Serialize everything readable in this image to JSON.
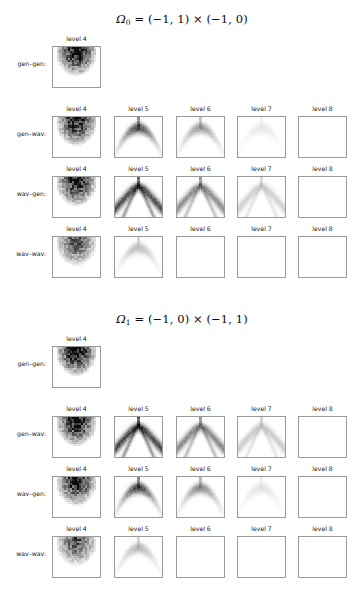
{
  "figure": {
    "width": 364,
    "height": 606,
    "background": "#ffffff",
    "panel_border_color": "#9a9a9a",
    "text_color": "#1a1a1a"
  },
  "chart_data": {
    "type": "heatmap",
    "title": "",
    "colormap": "grayscale (white = 0, black = max)",
    "row_labels": [
      "gen–gen:",
      "gen–wav:",
      "wav–gen:",
      "wav–wav:"
    ],
    "column_labels": [
      "level 4",
      "level 5",
      "level 6",
      "level 7",
      "level 8"
    ],
    "blocks": [
      {
        "id": "omega0",
        "title_plain": "Ω₀ = (−1,1) × (−1,0)",
        "title_parts": {
          "symbol": "Ω",
          "subscript": "0",
          "equals": "=",
          "interval_x": "(−1, 1)",
          "times": "×",
          "interval_y": "(−1, 0)"
        },
        "orientation": "vertical",
        "rows": [
          {
            "label": "gen–gen:",
            "panels": [
              {
                "level_label": "level 4",
                "kind": "blob",
                "intensity": 1.0,
                "blur": 0.0,
                "seed": 11
              }
            ]
          },
          {
            "label": "gen–wav:",
            "panels": [
              {
                "level_label": "level 4",
                "kind": "blob",
                "intensity": 0.92,
                "blur": 0.0,
                "seed": 21
              },
              {
                "level_label": "level 5",
                "kind": "arc",
                "intensity": 0.62,
                "blur": 1.0,
                "seed": 22
              },
              {
                "level_label": "level 6",
                "kind": "arc",
                "intensity": 0.34,
                "blur": 1.0,
                "seed": 23
              },
              {
                "level_label": "level 7",
                "kind": "arc",
                "intensity": 0.08,
                "blur": 1.0,
                "seed": 24
              },
              {
                "level_label": "level 8",
                "kind": "empty",
                "intensity": 0.01,
                "blur": 1.0,
                "seed": 25
              }
            ]
          },
          {
            "label": "wav–gen:",
            "panels": [
              {
                "level_label": "level 4",
                "kind": "blob",
                "intensity": 0.95,
                "blur": 0.0,
                "seed": 31
              },
              {
                "level_label": "level 5",
                "kind": "vee",
                "intensity": 0.7,
                "blur": 1.0,
                "seed": 32
              },
              {
                "level_label": "level 6",
                "kind": "vee",
                "intensity": 0.45,
                "blur": 1.0,
                "seed": 33
              },
              {
                "level_label": "level 7",
                "kind": "vee",
                "intensity": 0.18,
                "blur": 1.0,
                "seed": 34
              },
              {
                "level_label": "level 8",
                "kind": "empty",
                "intensity": 0.02,
                "blur": 1.0,
                "seed": 35
              }
            ]
          },
          {
            "label": "wav–wav:",
            "panels": [
              {
                "level_label": "level 4",
                "kind": "blob",
                "intensity": 0.7,
                "blur": 0.0,
                "seed": 41
              },
              {
                "level_label": "level 5",
                "kind": "arc",
                "intensity": 0.22,
                "blur": 1.0,
                "seed": 42
              },
              {
                "level_label": "level 6",
                "kind": "empty",
                "intensity": 0.01,
                "blur": 1.0,
                "seed": 43
              },
              {
                "level_label": "level 7",
                "kind": "empty",
                "intensity": 0.0,
                "blur": 1.0,
                "seed": 44
              },
              {
                "level_label": "level 8",
                "kind": "empty",
                "intensity": 0.0,
                "blur": 1.0,
                "seed": 45
              }
            ]
          }
        ]
      },
      {
        "id": "omega1",
        "title_plain": "Ω₁ = (−1,0) × (−1,1)",
        "title_parts": {
          "symbol": "Ω",
          "subscript": "1",
          "equals": "=",
          "interval_x": "(−1, 0)",
          "times": "×",
          "interval_y": "(−1, 1)"
        },
        "orientation": "horizontal",
        "rows": [
          {
            "label": "gen–gen:",
            "panels": [
              {
                "level_label": "level 4",
                "kind": "blob",
                "intensity": 1.0,
                "blur": 0.0,
                "seed": 51
              }
            ]
          },
          {
            "label": "gen–wav:",
            "panels": [
              {
                "level_label": "level 4",
                "kind": "blob",
                "intensity": 0.95,
                "blur": 0.0,
                "seed": 61
              },
              {
                "level_label": "level 5",
                "kind": "vee",
                "intensity": 0.72,
                "blur": 1.0,
                "seed": 62
              },
              {
                "level_label": "level 6",
                "kind": "vee",
                "intensity": 0.46,
                "blur": 1.0,
                "seed": 63
              },
              {
                "level_label": "level 7",
                "kind": "vee",
                "intensity": 0.2,
                "blur": 1.0,
                "seed": 64
              },
              {
                "level_label": "level 8",
                "kind": "empty",
                "intensity": 0.04,
                "blur": 1.0,
                "seed": 65
              }
            ]
          },
          {
            "label": "wav–gen:",
            "panels": [
              {
                "level_label": "level 4",
                "kind": "blob",
                "intensity": 0.92,
                "blur": 0.0,
                "seed": 71
              },
              {
                "level_label": "level 5",
                "kind": "arc",
                "intensity": 0.66,
                "blur": 1.0,
                "seed": 72
              },
              {
                "level_label": "level 6",
                "kind": "arc",
                "intensity": 0.4,
                "blur": 1.0,
                "seed": 73
              },
              {
                "level_label": "level 7",
                "kind": "arc",
                "intensity": 0.1,
                "blur": 1.0,
                "seed": 74
              },
              {
                "level_label": "level 8",
                "kind": "empty",
                "intensity": 0.01,
                "blur": 1.0,
                "seed": 75
              }
            ]
          },
          {
            "label": "wav–wav:",
            "panels": [
              {
                "level_label": "level 4",
                "kind": "blob",
                "intensity": 0.68,
                "blur": 0.0,
                "seed": 81
              },
              {
                "level_label": "level 5",
                "kind": "arc",
                "intensity": 0.24,
                "blur": 1.0,
                "seed": 82
              },
              {
                "level_label": "level 6",
                "kind": "empty",
                "intensity": 0.01,
                "blur": 1.0,
                "seed": 83
              },
              {
                "level_label": "level 7",
                "kind": "empty",
                "intensity": 0.0,
                "blur": 1.0,
                "seed": 84
              },
              {
                "level_label": "level 8",
                "kind": "empty",
                "intensity": 0.0,
                "blur": 1.0,
                "seed": 85
              }
            ]
          }
        ]
      }
    ],
    "layout": {
      "panel_left_positions": [
        52,
        114,
        176,
        237,
        298
      ],
      "panel_width": 49,
      "panel_height": 42,
      "block_tops": [
        12,
        312
      ],
      "row_tops": [
        22,
        92,
        152,
        212
      ]
    }
  }
}
